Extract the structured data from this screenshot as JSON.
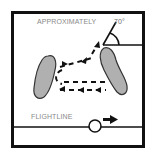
{
  "diagram": {
    "labels": {
      "approx": "APPROXIMATELY",
      "angle": "70°",
      "flightline": "FLIGHTLINE"
    },
    "colors": {
      "frame": "#111111",
      "shape_fill": "#b0b0b0",
      "shape_stroke": "#333333",
      "text": "#8a8a8a",
      "line": "#111111"
    },
    "elements": [
      {
        "name": "left-obstacle",
        "type": "shape"
      },
      {
        "name": "right-obstacle",
        "type": "shape"
      },
      {
        "name": "angle-marker",
        "type": "annotation",
        "value": "70°"
      },
      {
        "name": "dashed-path",
        "type": "path",
        "description": "U-turn dashed route between obstacles with directional arrows"
      },
      {
        "name": "flightline",
        "type": "line"
      },
      {
        "name": "ball",
        "type": "marker"
      },
      {
        "name": "direction-arrow",
        "type": "arrow",
        "direction": "right"
      }
    ]
  }
}
